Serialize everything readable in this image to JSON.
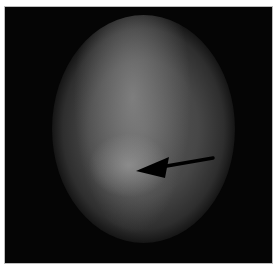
{
  "image": {
    "description": "Grayscale transilluminated oval (egg-shaped) image on a black background with a black arrow pointing left toward a bright spot in the lower-left interior",
    "background_color": "#050505",
    "frame_border_color": "#bdbdbd",
    "oval_tone": "#5a5a5a",
    "highlight_tone": "#9a9a9a",
    "arrow": {
      "color": "#000000",
      "direction": "left",
      "tail": [
        208,
        151
      ],
      "tip": [
        131,
        164
      ]
    }
  }
}
